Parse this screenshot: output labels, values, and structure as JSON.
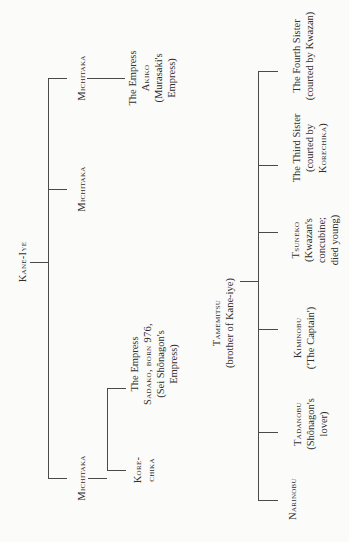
{
  "tree": {
    "root": {
      "name": "Kane-Iye"
    },
    "children": [
      {
        "name": "Michitaka",
        "id": "michitaka-1",
        "child": {
          "lines": [
            "The Empress",
            "Akiko",
            "(Murasaki's",
            "Empress)"
          ]
        }
      },
      {
        "name": "Michitaka",
        "id": "michitaka-2"
      },
      {
        "name": "Michitaka",
        "id": "michitaka-3",
        "children": [
          {
            "lines": [
              "The Empress",
              "Sadako, born 976,",
              "(Sei Shônagon's",
              "Empress)"
            ]
          },
          {
            "lines": [
              "Kore-",
              "chika"
            ]
          }
        ]
      }
    ],
    "second_root": {
      "name": "Tamemitsu",
      "note": "(brother of Kane-iye)"
    },
    "second_children": [
      {
        "lines": [
          "The Fourth Sister",
          "(courted by Kwazan)"
        ]
      },
      {
        "lines": [
          "The Third Sister",
          "(courted by",
          "Korechika)"
        ]
      },
      {
        "lines": [
          "Tsuneko",
          "(Kwazan's",
          "concubine;",
          "died young)"
        ]
      },
      {
        "lines": [
          "Kiminobu",
          "('The Captain')"
        ]
      },
      {
        "lines": [
          "Tadanobu",
          "(Shônagon's",
          "lover)"
        ]
      },
      {
        "lines": [
          "Narinobu"
        ]
      }
    ]
  }
}
